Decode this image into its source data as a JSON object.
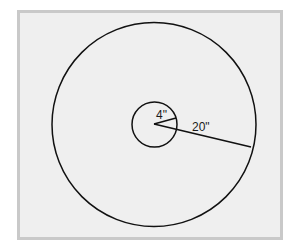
{
  "diagram": {
    "type": "concentric-circles",
    "inner_circle": {
      "radius_label": "4\""
    },
    "outer_circle": {
      "radius_label": "20\""
    },
    "colors": {
      "stroke": "#111111",
      "fill": "#efefef",
      "frame": "#c9c9c9"
    }
  }
}
